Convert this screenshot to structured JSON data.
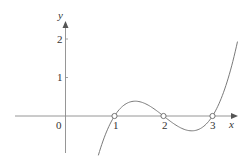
{
  "chart_data": {
    "type": "line",
    "title": "",
    "xlabel": "x",
    "ylabel": "y",
    "function": "y = (x-1)(x-2)(x-3)",
    "x_range_plotted": [
      0.67,
      3.51
    ],
    "xlim": [
      -1,
      3.5
    ],
    "ylim": [
      -1,
      2.2
    ],
    "x_ticks": [
      1,
      2,
      3
    ],
    "x_tick_labels": [
      "1",
      "2",
      "3"
    ],
    "y_ticks": [
      1,
      2
    ],
    "y_tick_labels": [
      "1",
      "2"
    ],
    "origin_label": "0",
    "open_points": [
      {
        "x": 1,
        "y": 0
      },
      {
        "x": 2,
        "y": 0
      },
      {
        "x": 3,
        "y": 0
      }
    ],
    "series": [
      {
        "name": "cubic",
        "x": [
          0.67,
          1,
          1.42,
          2,
          2.58,
          3,
          3.51
        ],
        "y": [
          -1.03,
          0,
          0.385,
          0,
          -0.385,
          0,
          1.93
        ]
      }
    ],
    "grid": false,
    "legend": null,
    "colors": {
      "axis": "#888888",
      "curve": "#777777",
      "text": "#333333"
    }
  },
  "labels": {
    "x_axis": "x",
    "y_axis": "y",
    "origin": "0",
    "x1": "1",
    "x2": "2",
    "x3": "3",
    "y1": "1",
    "y2": "2"
  }
}
